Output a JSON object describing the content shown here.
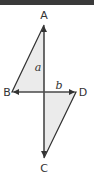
{
  "diagram": {
    "vertices": {
      "A": "A",
      "B": "B",
      "C": "C",
      "D": "D"
    },
    "diagonal_labels": {
      "vertical": "a",
      "horizontal": "b"
    },
    "colors": {
      "fill": "#ebebeb",
      "stroke": "#333333",
      "topbar": "#3a3a3a"
    }
  }
}
